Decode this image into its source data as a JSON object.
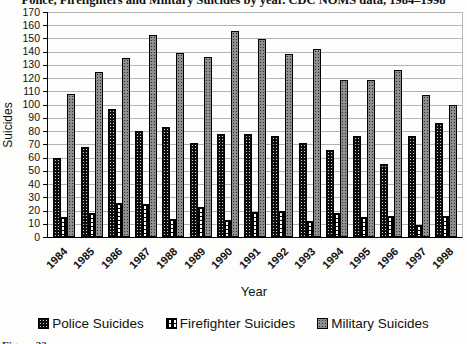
{
  "title": "Police, Firefighters and Military Suicides by year. CDC NOMS data, 1984–1998",
  "caption_fragment": "Figure 22",
  "chart_data": {
    "type": "bar",
    "title": "Police, Firefighters and Military Suicides by year. CDC NOMS data, 1984–1998",
    "xlabel": "Year",
    "ylabel": "Suicides",
    "ylim": [
      0,
      170
    ],
    "ytick_step": 10,
    "yticks": [
      0,
      10,
      20,
      30,
      40,
      50,
      60,
      70,
      80,
      90,
      100,
      110,
      120,
      130,
      140,
      150,
      160,
      170
    ],
    "grid": true,
    "legend_position": "bottom",
    "categories": [
      "1984",
      "1985",
      "1986",
      "1987",
      "1988",
      "1989",
      "1990",
      "1991",
      "1992",
      "1993",
      "1994",
      "1995",
      "1996",
      "1997",
      "1998"
    ],
    "series": [
      {
        "name": "Police Suicides",
        "style": "police",
        "color": "#0d0d0d",
        "values": [
          60,
          68,
          97,
          80,
          83,
          71,
          78,
          78,
          76,
          71,
          66,
          76,
          55,
          76,
          86
        ]
      },
      {
        "name": "Firefighter Suicides",
        "style": "fire",
        "color": "#000000",
        "values": [
          15,
          18,
          26,
          25,
          14,
          23,
          13,
          19,
          20,
          12,
          18,
          15,
          16,
          9,
          16
        ]
      },
      {
        "name": "Military Suicides",
        "style": "military",
        "color": "#8e8e8e",
        "values": [
          108,
          125,
          135,
          153,
          139,
          136,
          156,
          150,
          138,
          142,
          119,
          119,
          126,
          107,
          100
        ]
      }
    ]
  }
}
